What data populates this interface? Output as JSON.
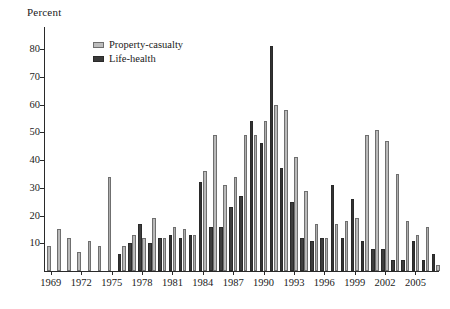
{
  "chart_data": {
    "type": "bar",
    "title": "",
    "subtitle": "",
    "ylabel": "Percent",
    "xlabel": "",
    "ylim": [
      0,
      88
    ],
    "grid": false,
    "legend_position": "top-left",
    "y_ticks": [
      10,
      20,
      30,
      40,
      50,
      60,
      70,
      80
    ],
    "x_tick_labels": [
      "1969",
      "1972",
      "1975",
      "1978",
      "1981",
      "1984",
      "1987",
      "1990",
      "1993",
      "1996",
      "1999",
      "2002",
      "2005"
    ],
    "categories": [
      "1969",
      "1970",
      "1971",
      "1972",
      "1973",
      "1974",
      "1975",
      "1976",
      "1977",
      "1978",
      "1979",
      "1980",
      "1981",
      "1982",
      "1983",
      "1984",
      "1985",
      "1986",
      "1987",
      "1988",
      "1989",
      "1990",
      "1991",
      "1992",
      "1993",
      "1994",
      "1995",
      "1996",
      "1997",
      "1998",
      "1999",
      "2000",
      "2001",
      "2002",
      "2003",
      "2004",
      "2005",
      "2006",
      "2007"
    ],
    "series": [
      {
        "name": "Property-casualty",
        "color": "#b7b7b7",
        "values": [
          9,
          15,
          12,
          7,
          11,
          9,
          34,
          9,
          13,
          12,
          19,
          12,
          16,
          15,
          13,
          36,
          49,
          31,
          34,
          49,
          49,
          54,
          60,
          58,
          41,
          29,
          17,
          12,
          17,
          18,
          19,
          49,
          51,
          47,
          35,
          18,
          13,
          16,
          2
        ]
      },
      {
        "name": "Life-health",
        "color": "#3a3a3a",
        "values": [
          0,
          0,
          0,
          0,
          0,
          0,
          0,
          6,
          10,
          17,
          10,
          12,
          13,
          12,
          13,
          32,
          16,
          16,
          23,
          27,
          54,
          46,
          81,
          37,
          25,
          12,
          11,
          12,
          31,
          12,
          26,
          11,
          8,
          8,
          4,
          4,
          11,
          4,
          6
        ]
      }
    ],
    "annotations": []
  },
  "legend": {
    "entries": [
      {
        "label": "Property-casualty",
        "swatch": "light-gray-swatch"
      },
      {
        "label": "Life-health",
        "swatch": "dark-gray-swatch"
      }
    ]
  }
}
